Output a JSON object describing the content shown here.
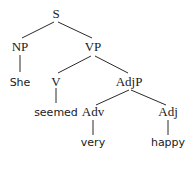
{
  "tree": {
    "nodes": {
      "S": "S",
      "NP": "NP",
      "VP": "VP",
      "She": "She",
      "V": "V",
      "AdjP": "AdjP",
      "seemed": "seemed",
      "Adv": "Adv",
      "Adj": "Adj",
      "very": "very",
      "happy": "happy"
    },
    "edges": [
      [
        "S",
        "NP"
      ],
      [
        "S",
        "VP"
      ],
      [
        "NP",
        "She"
      ],
      [
        "VP",
        "V"
      ],
      [
        "VP",
        "AdjP"
      ],
      [
        "V",
        "seemed"
      ],
      [
        "AdjP",
        "Adv"
      ],
      [
        "AdjP",
        "Adj"
      ],
      [
        "Adv",
        "very"
      ],
      [
        "Adj",
        "happy"
      ]
    ],
    "sentence": "She seemed very happy"
  }
}
